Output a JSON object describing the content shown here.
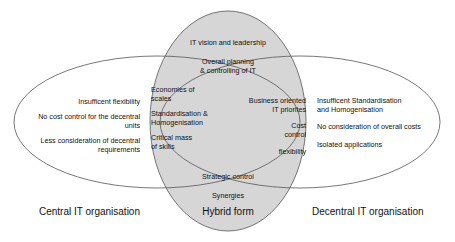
{
  "colors": {
    "hybrid_fill": "#d6d6d6",
    "stroke": "#555555",
    "background": "#ffffff"
  },
  "central": {
    "label": "Central IT organisation",
    "items": [
      "Insufficent flexibility",
      "No cost control for the decentral",
      "units",
      "Less consideration of decentral",
      "requirements"
    ]
  },
  "hybrid": {
    "label": "Hybrid form",
    "top_items": [
      "IT vision and leadership",
      "Overall planning",
      "& controlling of IT"
    ],
    "bottom_items": [
      "Strategic control",
      "Synergies"
    ]
  },
  "overlap_left": {
    "items": [
      "Economies of",
      "scales",
      "Standardisation &",
      "Homogenisation",
      "Critical mass",
      "of skills"
    ]
  },
  "overlap_right": {
    "items": [
      "Business oriented",
      "IT priorites",
      "Cost",
      "control",
      "flexibility"
    ]
  },
  "decentral": {
    "label": "Decentral IT organisation",
    "items": [
      "Insufficent Standardisation",
      "and Homogenisation",
      "No consideration of overall costs",
      "Isolated applications"
    ]
  }
}
